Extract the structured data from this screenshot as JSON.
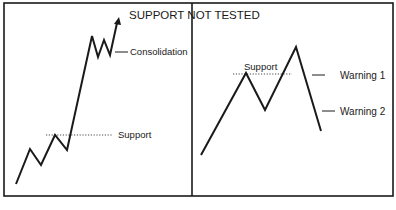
{
  "title": "SUPPORT NOT TESTED",
  "left_panel": {
    "labels": {
      "consolidation": "Consolidation",
      "support": "Support"
    }
  },
  "right_panel": {
    "labels": {
      "support": "Support",
      "warning1": "Warning 1",
      "warning2": "Warning 2"
    }
  },
  "colors": {
    "ink": "#1a1a1a",
    "background": "#ffffff"
  }
}
